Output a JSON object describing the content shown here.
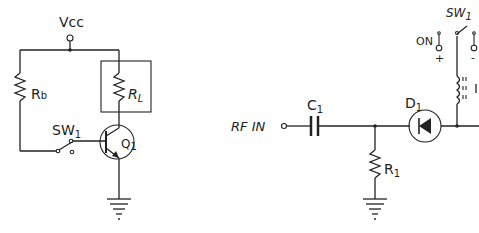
{
  "left_circuit": {
    "supply": {
      "label": "Vcc"
    },
    "base_resistor": {
      "label": "R",
      "sub": "b"
    },
    "load_resistor": {
      "label": "R",
      "sub": "L"
    },
    "switch": {
      "label": "SW",
      "sub": "1"
    },
    "transistor": {
      "label": "Q",
      "sub": "1",
      "type": "NPN"
    },
    "ground": {
      "symbol": "ground-icon"
    }
  },
  "right_circuit": {
    "input": {
      "label": "RF IN"
    },
    "capacitor": {
      "label": "C",
      "sub": "1"
    },
    "resistor": {
      "label": "R",
      "sub": "1"
    },
    "diode": {
      "label": "D",
      "sub": "1"
    },
    "switch": {
      "label": "SW",
      "sub": "1"
    },
    "on_terminal": {
      "label": "ON",
      "plus": "+",
      "minus": "-"
    },
    "inductor": {
      "label": "L"
    },
    "ground": {
      "symbol": "ground-icon"
    }
  }
}
